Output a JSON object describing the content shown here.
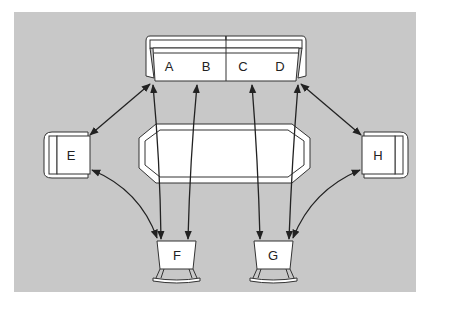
{
  "diagram": {
    "type": "floor-plan-seating",
    "background_color": "#c8c8c8",
    "line_color": "#222222",
    "furniture": {
      "sofa": {
        "seats": [
          "A",
          "B",
          "C",
          "D"
        ]
      },
      "table": {
        "shape": "elongated-octagon"
      },
      "armchair_left": {
        "label": "E"
      },
      "armchair_right": {
        "label": "H"
      },
      "chair_front_left": {
        "label": "F"
      },
      "chair_front_right": {
        "label": "G"
      }
    },
    "connections": [
      {
        "from": "A",
        "to": "E",
        "bidirectional": true
      },
      {
        "from": "A",
        "to": "F",
        "bidirectional": true
      },
      {
        "from": "B",
        "to": "F",
        "bidirectional": true
      },
      {
        "from": "C",
        "to": "G",
        "bidirectional": true
      },
      {
        "from": "D",
        "to": "G",
        "bidirectional": true
      },
      {
        "from": "D",
        "to": "H",
        "bidirectional": true
      },
      {
        "from": "E",
        "to": "F",
        "bidirectional": true
      },
      {
        "from": "H",
        "to": "G",
        "bidirectional": true
      }
    ]
  }
}
